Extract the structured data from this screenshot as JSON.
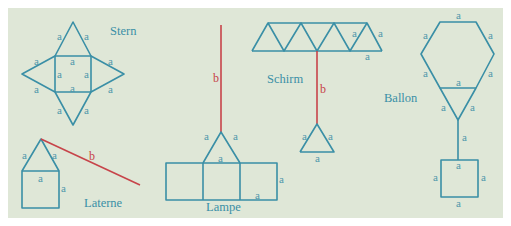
{
  "colors": {
    "background": "#dfe7d7",
    "edge": "#3a8fa6",
    "string": "#c7444a",
    "label": "#4f97ab"
  },
  "edge_label": "a",
  "string_label": "b",
  "figures": {
    "stern": {
      "title": "Stern"
    },
    "laterne": {
      "title": "Laterne"
    },
    "lampe": {
      "title": "Lampe"
    },
    "schirm": {
      "title": "Schirm"
    },
    "ballon": {
      "title": "Ballon"
    }
  }
}
